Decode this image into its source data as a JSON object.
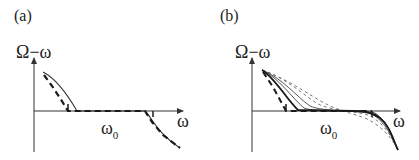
{
  "panels": [
    {
      "id": "a",
      "label": "(a)",
      "y_axis_label": "Ω−ω",
      "x_axis_label": "ω",
      "marker_label": "ω",
      "marker_sub": "0",
      "curves": [
        {
          "style": "solid",
          "description": "exact Ω−ω vs ω"
        },
        {
          "style": "dashed-thick",
          "description": "approximate (piecewise) Ω−ω vs ω"
        }
      ]
    },
    {
      "id": "b",
      "label": "(b)",
      "y_axis_label": "Ω−ω",
      "x_axis_label": "ω",
      "marker_label": "ω",
      "marker_sub": "0",
      "curves": [
        {
          "style": "solid-thick",
          "description": "outermost curve"
        },
        {
          "style": "solid-thin",
          "description": "intermediate curve 1"
        },
        {
          "style": "solid-thin",
          "description": "intermediate curve 2"
        },
        {
          "style": "dashed-thin",
          "description": "dashed curve 1"
        },
        {
          "style": "dashed-thin",
          "description": "dashed curve 2"
        },
        {
          "style": "dashed-thick",
          "description": "piecewise limit curve"
        }
      ]
    }
  ],
  "colors": {
    "line": "#1a1a1a",
    "thin_line": "#444444",
    "dashed_thin": "#666666"
  }
}
